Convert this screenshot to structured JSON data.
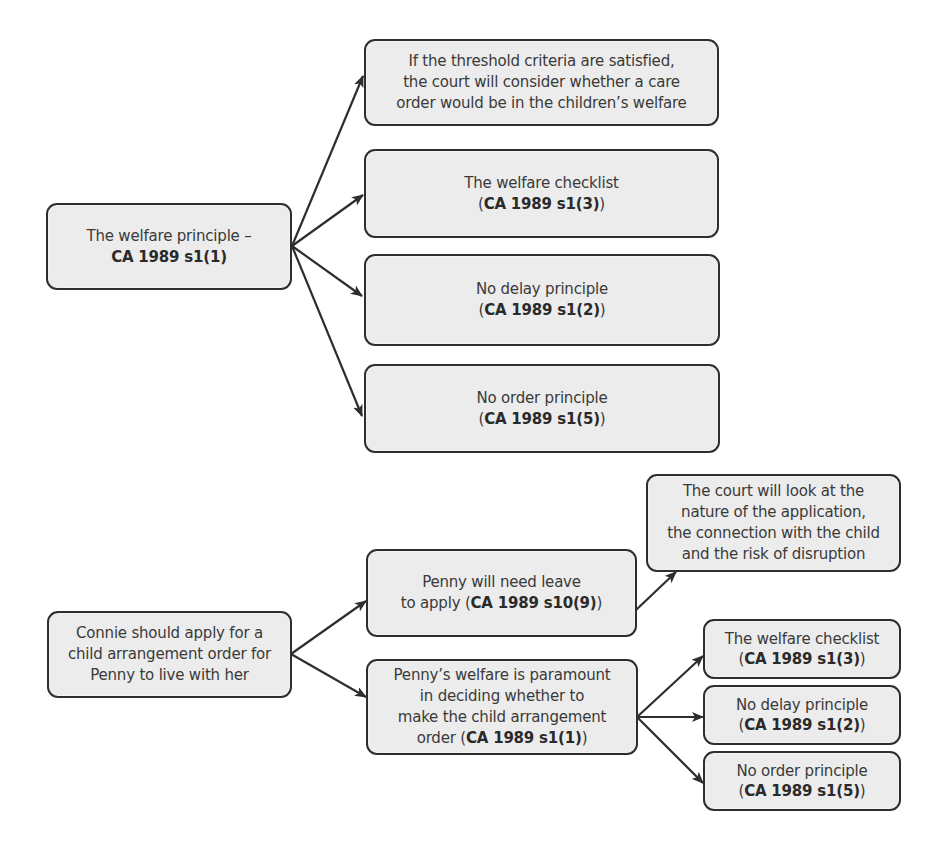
{
  "diagrams": [
    {
      "id": "care-order-welfare",
      "nodes": {
        "root": {
          "lines": [
            {
              "text": "The welfare principle –",
              "cite": ""
            },
            {
              "text": "",
              "cite": "CA 1989 s1(1)",
              "parens": false
            }
          ]
        },
        "threshold": {
          "lines": [
            {
              "text": "If the threshold criteria are satisfied,"
            },
            {
              "text": "the court will consider whether a care"
            },
            {
              "text": "order would be in the children’s welfare"
            }
          ]
        },
        "checklist": {
          "title": "The welfare checklist",
          "cite": "CA 1989 s1(3)"
        },
        "no_delay": {
          "title": "No delay principle",
          "cite": "CA 1989 s1(2)"
        },
        "no_order": {
          "title": "No order principle",
          "cite": "CA 1989 s1(5)"
        }
      },
      "edges": [
        [
          "root",
          "threshold"
        ],
        [
          "root",
          "checklist"
        ],
        [
          "root",
          "no_delay"
        ],
        [
          "root",
          "no_order"
        ]
      ]
    },
    {
      "id": "child-arrangement-order",
      "nodes": {
        "root": {
          "lines": [
            {
              "text": "Connie should apply for a"
            },
            {
              "text": "child arrangement order for"
            },
            {
              "text": "Penny to live with her"
            }
          ]
        },
        "leave": {
          "line1": "Penny will need leave",
          "line2_prefix": "to apply (",
          "cite": "CA 1989 s10(9)",
          "line2_suffix": ")"
        },
        "leave_factors": {
          "lines": [
            {
              "text": "The court will look at the"
            },
            {
              "text": "nature of the application,"
            },
            {
              "text": "the connection with the child"
            },
            {
              "text": "and the risk of disruption"
            }
          ]
        },
        "paramount": {
          "line1": "Penny’s welfare is paramount",
          "line2": "in deciding whether to",
          "line3": "make the child arrangement",
          "line4_prefix": "order (",
          "cite": "CA 1989 s1(1)",
          "line4_suffix": ")"
        },
        "checklist": {
          "title": "The welfare checklist",
          "cite": "CA 1989 s1(3)"
        },
        "no_delay": {
          "title": "No delay principle",
          "cite": "CA 1989 s1(2)"
        },
        "no_order": {
          "title": "No order principle",
          "cite": "CA 1989 s1(5)"
        }
      },
      "edges": [
        [
          "root",
          "leave"
        ],
        [
          "root",
          "paramount"
        ],
        [
          "leave",
          "leave_factors"
        ],
        [
          "paramount",
          "checklist"
        ],
        [
          "paramount",
          "no_delay"
        ],
        [
          "paramount",
          "no_order"
        ]
      ]
    }
  ],
  "colors": {
    "box_fill": "#ececec",
    "box_border": "#2e2e2e",
    "arrow": "#2e2e2e",
    "text": "#3a3a3a"
  }
}
